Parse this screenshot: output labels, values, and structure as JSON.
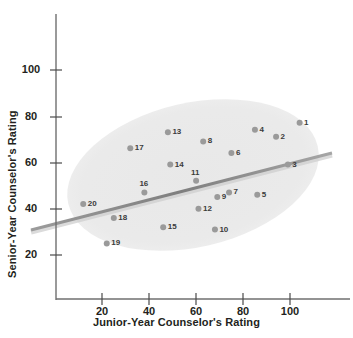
{
  "chart_data": {
    "type": "scatter",
    "title": "",
    "xlabel": "Junior-Year Counselor's Rating",
    "ylabel": "Senior-Year Counselor's Rating",
    "xlim": [
      0,
      120
    ],
    "ylim": [
      0,
      120
    ],
    "xticks": [
      20,
      40,
      60,
      80,
      100
    ],
    "yticks": [
      20,
      40,
      60,
      80,
      100
    ],
    "grid": false,
    "legend": null,
    "annotations": {
      "ellipse_note": "light gray shaded confidence ellipse tilted upward to the right enclosing all data points",
      "trend_line_note": "gray regression line drawn from lower-left to upper-right, extending past the data",
      "trend_line": {
        "x1": -10,
        "y1": 33,
        "x2": 117,
        "y2": 66
      }
    },
    "points": [
      {
        "label": "1",
        "x": 104,
        "y": 77
      },
      {
        "label": "2",
        "x": 94,
        "y": 71
      },
      {
        "label": "3",
        "x": 99,
        "y": 59
      },
      {
        "label": "4",
        "x": 85,
        "y": 74
      },
      {
        "label": "5",
        "x": 86,
        "y": 46
      },
      {
        "label": "6",
        "x": 75,
        "y": 64
      },
      {
        "label": "7",
        "x": 74,
        "y": 47
      },
      {
        "label": "8",
        "x": 63,
        "y": 69
      },
      {
        "label": "9",
        "x": 69,
        "y": 45
      },
      {
        "label": "10",
        "x": 68,
        "y": 31
      },
      {
        "label": "11",
        "x": 60,
        "y": 52
      },
      {
        "label": "12",
        "x": 61,
        "y": 40
      },
      {
        "label": "13",
        "x": 48,
        "y": 73
      },
      {
        "label": "14",
        "x": 49,
        "y": 59
      },
      {
        "label": "15",
        "x": 46,
        "y": 32
      },
      {
        "label": "16",
        "x": 38,
        "y": 47
      },
      {
        "label": "17",
        "x": 32,
        "y": 66
      },
      {
        "label": "18",
        "x": 25,
        "y": 36
      },
      {
        "label": "19",
        "x": 22,
        "y": 25
      },
      {
        "label": "20",
        "x": 12,
        "y": 42
      }
    ]
  },
  "colors": {
    "axis": "#231f20",
    "point_fill": "#9a9a9a",
    "ellipse_fill": "#eaeaea",
    "trend_line": "#8a8a8a",
    "label_text": "#3b3b3b",
    "background": "#ffffff"
  },
  "icons": {
    "data_point": "circle-marker-icon"
  }
}
